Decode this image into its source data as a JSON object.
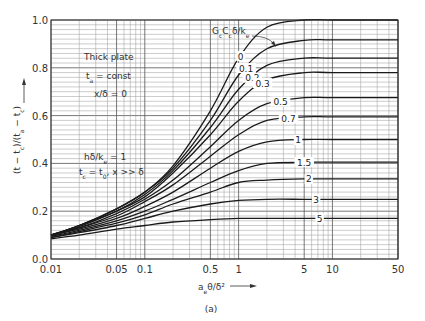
{
  "chart_data": {
    "type": "line",
    "title": "",
    "caption": "(a)",
    "xlabel": "a_e θ/δ²",
    "ylabel": "(t − t_c)/(t_a − t_c)",
    "xscale": "log",
    "xlim": [
      0.01,
      50
    ],
    "ylim": [
      0.0,
      1.0
    ],
    "grid": true,
    "x_ticks": [
      "0.01",
      "0.05",
      "0.1",
      "0.5",
      "1",
      "5",
      "10",
      "50"
    ],
    "y_ticks": [
      "0.0",
      "0.2",
      "0.4",
      "0.6",
      "0.8",
      "1.0"
    ],
    "parameter_label": "G_c C_c δ/k_e",
    "annotations": [
      "Thick plate",
      "t_a = const",
      "x/δ = 0",
      "hδ/k_e = 1",
      "t_c = t_0, x >> δ"
    ],
    "x": [
      0.01,
      0.02,
      0.05,
      0.1,
      0.2,
      0.5,
      1,
      2,
      5,
      10,
      50
    ],
    "series": [
      {
        "name": "0",
        "values": [
          0.1,
          0.14,
          0.21,
          0.28,
          0.39,
          0.62,
          0.84,
          0.97,
          1.0,
          1.0,
          1.0
        ]
      },
      {
        "name": "0.1",
        "values": [
          0.1,
          0.14,
          0.21,
          0.28,
          0.38,
          0.58,
          0.77,
          0.88,
          0.915,
          0.917,
          0.917
        ]
      },
      {
        "name": "0.2",
        "values": [
          0.1,
          0.14,
          0.2,
          0.27,
          0.37,
          0.55,
          0.71,
          0.81,
          0.84,
          0.84,
          0.84
        ]
      },
      {
        "name": "0.3",
        "values": [
          0.1,
          0.135,
          0.2,
          0.26,
          0.36,
          0.52,
          0.66,
          0.75,
          0.78,
          0.78,
          0.78
        ]
      },
      {
        "name": "0.5",
        "values": [
          0.1,
          0.13,
          0.19,
          0.25,
          0.33,
          0.47,
          0.58,
          0.65,
          0.675,
          0.675,
          0.675
        ]
      },
      {
        "name": "0.7",
        "values": [
          0.1,
          0.13,
          0.18,
          0.24,
          0.31,
          0.43,
          0.52,
          0.58,
          0.595,
          0.595,
          0.595
        ]
      },
      {
        "name": "1",
        "values": [
          0.1,
          0.125,
          0.17,
          0.22,
          0.28,
          0.38,
          0.45,
          0.49,
          0.5,
          0.5,
          0.5
        ]
      },
      {
        "name": "1.5",
        "values": [
          0.095,
          0.12,
          0.16,
          0.2,
          0.25,
          0.32,
          0.37,
          0.4,
          0.405,
          0.405,
          0.405
        ]
      },
      {
        "name": "2",
        "values": [
          0.09,
          0.115,
          0.15,
          0.185,
          0.23,
          0.28,
          0.32,
          0.33,
          0.335,
          0.335,
          0.335
        ]
      },
      {
        "name": "3",
        "values": [
          0.09,
          0.11,
          0.14,
          0.17,
          0.2,
          0.23,
          0.245,
          0.25,
          0.25,
          0.25,
          0.25
        ]
      },
      {
        "name": "5",
        "values": [
          0.085,
          0.1,
          0.125,
          0.14,
          0.155,
          0.165,
          0.17,
          0.17,
          0.17,
          0.17,
          0.17
        ]
      }
    ],
    "curve_label_positions": [
      {
        "name": "0",
        "x": 1.05
      },
      {
        "name": "0.1",
        "x": 1.2
      },
      {
        "name": "0.2",
        "x": 1.4
      },
      {
        "name": "0.3",
        "x": 1.8
      },
      {
        "name": "0.5",
        "x": 2.8
      },
      {
        "name": "0.7",
        "x": 3.4
      },
      {
        "name": "1",
        "x": 4.3
      },
      {
        "name": "1.5",
        "x": 5.0
      },
      {
        "name": "2",
        "x": 5.6
      },
      {
        "name": "3",
        "x": 6.7
      },
      {
        "name": "5",
        "x": 7.3
      }
    ]
  },
  "labels": {
    "xlabel_display": "a",
    "xlabel_sub": "e",
    "xlabel_rest": "θ/δ²",
    "ylabel_display": "(t − t",
    "caption": "(a)",
    "param": "G",
    "note1": "Thick plate",
    "note2": "t",
    "note3": "x/δ = 0",
    "note4": "hδ/k",
    "note5": "t"
  },
  "colors": {
    "line": "#1a1a1a",
    "grid_major": "#555555",
    "grid_minor": "#999999",
    "text": "#333333",
    "background": "#ffffff"
  }
}
